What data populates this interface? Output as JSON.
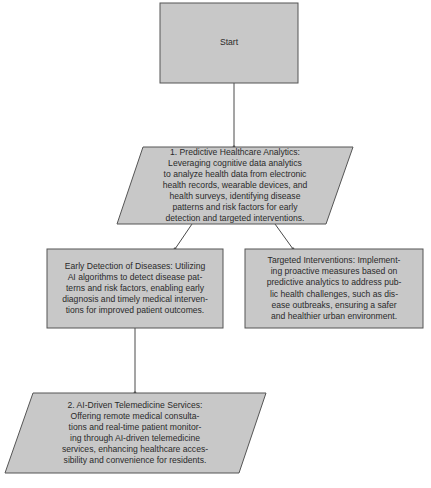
{
  "colors": {
    "node_fill": "#c8c8c8",
    "node_stroke": "#555555",
    "connector": "#4a4a4a",
    "text": "#2a2a2a",
    "background": "#ffffff"
  },
  "nodes": {
    "start": {
      "shape": "rectangle",
      "label": "Start"
    },
    "predictive_analytics": {
      "shape": "parallelogram",
      "lines": [
        "1. Predictive Healthcare Analytics:",
        "Leveraging cognitive data analytics",
        "to analyze health data from electronic",
        "health records, wearable devices, and",
        "health surveys, identifying disease",
        "patterns and risk factors for early",
        "detection and targeted interventions."
      ]
    },
    "early_detection": {
      "shape": "rectangle",
      "lines": [
        "Early Detection of Diseases: Utilizing",
        "AI algorithms to detect disease pat-",
        "terns and risk factors, enabling early",
        "diagnosis and timely medical interven-",
        "tions for improved patient outcomes."
      ]
    },
    "targeted_interventions": {
      "shape": "rectangle",
      "lines": [
        "Targeted Interventions: Implement-",
        "ing proactive measures based on",
        "predictive analytics to address pub-",
        "lic health challenges, such as dis-",
        "ease outbreaks, ensuring a safer",
        "and healthier urban environment."
      ]
    },
    "telemedicine": {
      "shape": "parallelogram",
      "lines": [
        "2. AI-Driven Telemedicine Services:",
        "Offering remote medical consulta-",
        "tions and real-time patient monitor-",
        "ing through AI-driven telemedicine",
        "services, enhancing healthcare acces-",
        "sibility and convenience for residents."
      ]
    }
  },
  "edges": [
    {
      "from": "start",
      "to": "predictive_analytics"
    },
    {
      "from": "predictive_analytics",
      "to": "early_detection"
    },
    {
      "from": "predictive_analytics",
      "to": "targeted_interventions"
    },
    {
      "from": "early_detection",
      "to": "telemedicine"
    }
  ]
}
